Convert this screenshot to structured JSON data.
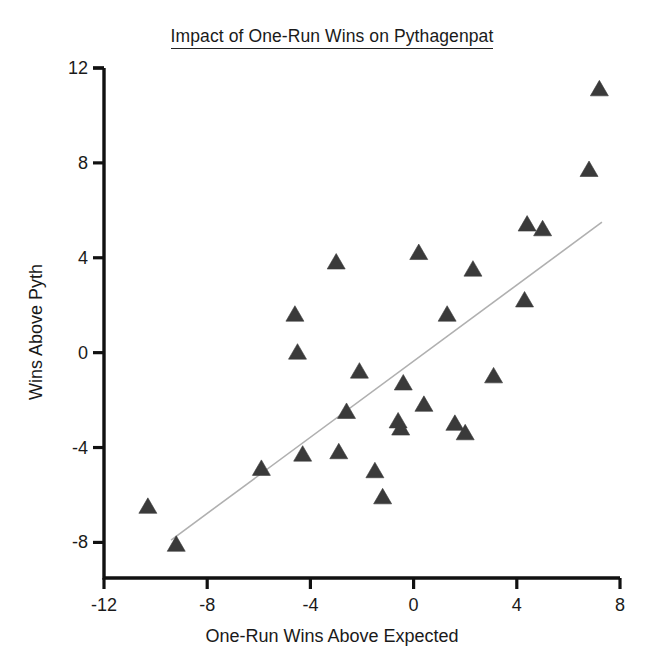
{
  "chart_data": {
    "type": "scatter",
    "title": "Impact of One-Run Wins on Pythagenpat",
    "xlabel": "One-Run Wins Above Expected",
    "ylabel": "Wins Above Pyth",
    "xlim": [
      -12,
      8
    ],
    "ylim": [
      -9.5,
      12
    ],
    "xticks": [
      -12,
      -8,
      -4,
      0,
      4,
      8
    ],
    "yticks": [
      -8,
      -4,
      0,
      4,
      8,
      12
    ],
    "xtick_labels": [
      "-12",
      "-8",
      "-4",
      "0",
      "4",
      "8"
    ],
    "ytick_labels": [
      "-8",
      "-4",
      "0",
      "4",
      "8",
      "12"
    ],
    "grid": false,
    "legend": null,
    "marker": "triangle-up",
    "marker_color": "#3a3a3a",
    "marker_size": 18,
    "axis_color": "#111111",
    "background": "#ffffff",
    "points": [
      {
        "x": -10.3,
        "y": -6.5
      },
      {
        "x": -9.2,
        "y": -8.1
      },
      {
        "x": -5.9,
        "y": -4.9
      },
      {
        "x": -4.6,
        "y": 1.6
      },
      {
        "x": -4.5,
        "y": 0.0
      },
      {
        "x": -4.3,
        "y": -4.3
      },
      {
        "x": -3.0,
        "y": 3.8
      },
      {
        "x": -2.9,
        "y": -4.2
      },
      {
        "x": -2.6,
        "y": -2.5
      },
      {
        "x": -2.1,
        "y": -0.8
      },
      {
        "x": -1.5,
        "y": -5.0
      },
      {
        "x": -1.2,
        "y": -6.1
      },
      {
        "x": -0.6,
        "y": -2.9
      },
      {
        "x": -0.5,
        "y": -3.2
      },
      {
        "x": -0.4,
        "y": -1.3
      },
      {
        "x": 0.2,
        "y": 4.2
      },
      {
        "x": 0.4,
        "y": -2.2
      },
      {
        "x": 1.3,
        "y": 1.6
      },
      {
        "x": 1.6,
        "y": -3.0
      },
      {
        "x": 2.0,
        "y": -3.4
      },
      {
        "x": 2.3,
        "y": 3.5
      },
      {
        "x": 3.1,
        "y": -1.0
      },
      {
        "x": 4.3,
        "y": 2.2
      },
      {
        "x": 4.4,
        "y": 5.4
      },
      {
        "x": 5.0,
        "y": 5.2
      },
      {
        "x": 6.8,
        "y": 7.7
      },
      {
        "x": 7.2,
        "y": 11.1
      }
    ],
    "trendline": {
      "style": "solid-thin",
      "color": "#b0b0b0",
      "x0": -9.4,
      "y0": -7.9,
      "x1": 7.3,
      "y1": 5.5
    }
  }
}
